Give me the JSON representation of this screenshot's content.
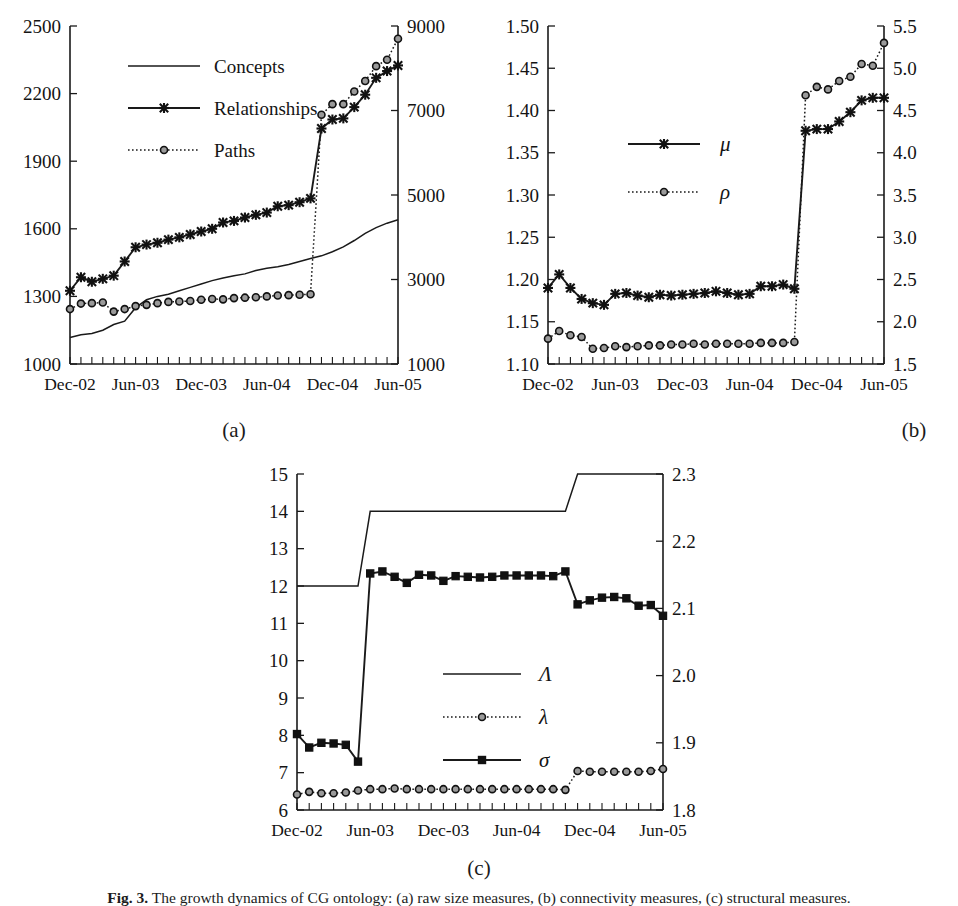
{
  "figure": {
    "caption_prefix": "Fig. 3.",
    "caption_text": "The growth dynamics of CG ontology: (a) raw size measures, (b) connectivity measures, (c) structural measures.",
    "panel_labels": [
      "(a)",
      "(b)",
      "(c)"
    ]
  },
  "chart_data": [
    {
      "id": "panel-a",
      "type": "line",
      "title": "",
      "xlabel": "",
      "ylabel": "",
      "grid": false,
      "legend_position": "upper-left",
      "x": [
        "Dec-02",
        "Jan-03",
        "Feb-03",
        "Mar-03",
        "Apr-03",
        "May-03",
        "Jun-03",
        "Jul-03",
        "Aug-03",
        "Sep-03",
        "Oct-03",
        "Nov-03",
        "Dec-03",
        "Jan-04",
        "Feb-04",
        "Mar-04",
        "Apr-04",
        "May-04",
        "Jun-04",
        "Jul-04",
        "Aug-04",
        "Sep-04",
        "Oct-04",
        "Nov-04",
        "Dec-04",
        "Jan-05",
        "Feb-05",
        "Mar-05",
        "Apr-05",
        "May-05",
        "Jun-05"
      ],
      "xtick_labels": [
        "Dec-02",
        "Jun-03",
        "Dec-03",
        "Jun-04",
        "Dec-04",
        "Jun-05"
      ],
      "xtick_positions": [
        0,
        6,
        12,
        18,
        24,
        30
      ],
      "left_axis": {
        "label": "",
        "ylim": [
          1000,
          2500
        ],
        "ticks": [
          1000,
          1300,
          1600,
          1900,
          2200,
          2500
        ]
      },
      "right_axis": {
        "label": "",
        "ylim": [
          1000,
          9000
        ],
        "ticks": [
          1000,
          3000,
          5000,
          7000,
          9000
        ]
      },
      "series": [
        {
          "name": "Concepts",
          "axis": "left",
          "style": "plain-line",
          "marker": "none",
          "values": [
            1118,
            1130,
            1135,
            1150,
            1175,
            1190,
            1250,
            1285,
            1300,
            1310,
            1325,
            1340,
            1355,
            1370,
            1382,
            1392,
            1400,
            1415,
            1425,
            1432,
            1442,
            1455,
            1468,
            1480,
            1498,
            1520,
            1548,
            1580,
            1605,
            1625,
            1640
          ]
        },
        {
          "name": "Relationships",
          "axis": "left",
          "style": "solid-line",
          "marker": "cross",
          "values": [
            1325,
            1385,
            1365,
            1378,
            1392,
            1455,
            1518,
            1530,
            1538,
            1552,
            1562,
            1575,
            1588,
            1600,
            1628,
            1635,
            1650,
            1662,
            1672,
            1700,
            1705,
            1718,
            1735,
            2045,
            2085,
            2090,
            2140,
            2195,
            2270,
            2300,
            2325
          ]
        },
        {
          "name": "Paths",
          "axis": "right",
          "style": "dotted-line",
          "marker": "circle",
          "values": [
            2300,
            2430,
            2440,
            2455,
            2240,
            2300,
            2370,
            2400,
            2440,
            2470,
            2480,
            2490,
            2520,
            2540,
            2530,
            2560,
            2570,
            2580,
            2600,
            2620,
            2630,
            2640,
            2650,
            6900,
            7150,
            7150,
            7450,
            7700,
            8050,
            8200,
            8700
          ]
        }
      ]
    },
    {
      "id": "panel-b",
      "type": "line",
      "title": "",
      "xlabel": "",
      "ylabel": "",
      "grid": false,
      "legend_position": "center",
      "x": [
        "Dec-02",
        "Jan-03",
        "Feb-03",
        "Mar-03",
        "Apr-03",
        "May-03",
        "Jun-03",
        "Jul-03",
        "Aug-03",
        "Sep-03",
        "Oct-03",
        "Nov-03",
        "Dec-03",
        "Jan-04",
        "Feb-04",
        "Mar-04",
        "Apr-04",
        "May-04",
        "Jun-04",
        "Jul-04",
        "Aug-04",
        "Sep-04",
        "Oct-04",
        "Nov-04",
        "Dec-04",
        "Jan-05",
        "Feb-05",
        "Mar-05",
        "Apr-05",
        "May-05",
        "Jun-05"
      ],
      "xtick_labels": [
        "Dec-02",
        "Jun-03",
        "Dec-03",
        "Jun-04",
        "Dec-04",
        "Jun-05"
      ],
      "xtick_positions": [
        0,
        6,
        12,
        18,
        24,
        30
      ],
      "left_axis": {
        "label": "",
        "ylim": [
          1.1,
          1.5
        ],
        "ticks": [
          1.1,
          1.15,
          1.2,
          1.25,
          1.3,
          1.35,
          1.4,
          1.45,
          1.5
        ]
      },
      "right_axis": {
        "label": "",
        "ylim": [
          1.5,
          5.5
        ],
        "ticks": [
          1.5,
          2.0,
          2.5,
          3.0,
          3.5,
          4.0,
          4.5,
          5.0,
          5.5
        ]
      },
      "series": [
        {
          "name": "μ",
          "axis": "left",
          "style": "solid-line",
          "marker": "cross",
          "values": [
            1.19,
            1.206,
            1.19,
            1.177,
            1.172,
            1.17,
            1.183,
            1.184,
            1.181,
            1.179,
            1.182,
            1.181,
            1.182,
            1.183,
            1.184,
            1.186,
            1.184,
            1.182,
            1.183,
            1.192,
            1.192,
            1.194,
            1.189,
            1.376,
            1.378,
            1.378,
            1.387,
            1.398,
            1.412,
            1.415,
            1.415
          ]
        },
        {
          "name": "ρ",
          "axis": "right",
          "style": "dotted-line",
          "marker": "circle",
          "values": [
            1.8,
            1.89,
            1.84,
            1.82,
            1.68,
            1.69,
            1.71,
            1.7,
            1.71,
            1.72,
            1.72,
            1.73,
            1.73,
            1.74,
            1.73,
            1.74,
            1.74,
            1.74,
            1.74,
            1.75,
            1.75,
            1.75,
            1.76,
            4.68,
            4.78,
            4.75,
            4.85,
            4.9,
            5.05,
            5.03,
            5.3
          ]
        }
      ]
    },
    {
      "id": "panel-c",
      "type": "line",
      "title": "",
      "xlabel": "",
      "ylabel": "",
      "grid": false,
      "legend_position": "center",
      "x": [
        "Dec-02",
        "Jan-03",
        "Feb-03",
        "Mar-03",
        "Apr-03",
        "May-03",
        "Jun-03",
        "Jul-03",
        "Aug-03",
        "Sep-03",
        "Oct-03",
        "Nov-03",
        "Dec-03",
        "Jan-04",
        "Feb-04",
        "Mar-04",
        "Apr-04",
        "May-04",
        "Jun-04",
        "Jul-04",
        "Aug-04",
        "Sep-04",
        "Oct-04",
        "Nov-04",
        "Dec-04",
        "Jan-05",
        "Feb-05",
        "Mar-05",
        "Apr-05",
        "May-05",
        "Jun-05"
      ],
      "xtick_labels": [
        "Dec-02",
        "Jun-03",
        "Dec-03",
        "Jun-04",
        "Dec-04",
        "Jun-05"
      ],
      "xtick_positions": [
        0,
        6,
        12,
        18,
        24,
        30
      ],
      "left_axis": {
        "label": "",
        "ylim": [
          6,
          15
        ],
        "ticks": [
          6,
          7,
          8,
          9,
          10,
          11,
          12,
          13,
          14,
          15
        ]
      },
      "right_axis": {
        "label": "",
        "ylim": [
          1.8,
          2.3
        ],
        "ticks": [
          1.8,
          1.9,
          2.0,
          2.1,
          2.2,
          2.3
        ]
      },
      "series": [
        {
          "name": "Λ",
          "axis": "left",
          "style": "plain-line",
          "marker": "none",
          "values": [
            12,
            12,
            12,
            12,
            12,
            12,
            14,
            14,
            14,
            14,
            14,
            14,
            14,
            14,
            14,
            14,
            14,
            14,
            14,
            14,
            14,
            14,
            14,
            15,
            15,
            15,
            15,
            15,
            15,
            15,
            15
          ]
        },
        {
          "name": "λ",
          "axis": "right",
          "style": "dotted-line",
          "marker": "circle",
          "values": [
            1.823,
            1.827,
            1.825,
            1.825,
            1.826,
            1.829,
            1.831,
            1.831,
            1.832,
            1.831,
            1.831,
            1.831,
            1.831,
            1.831,
            1.831,
            1.831,
            1.831,
            1.831,
            1.831,
            1.831,
            1.831,
            1.831,
            1.83,
            1.858,
            1.857,
            1.857,
            1.857,
            1.857,
            1.857,
            1.858,
            1.861
          ]
        },
        {
          "name": "σ",
          "axis": "right",
          "style": "solid-line",
          "marker": "square",
          "values": [
            1.913,
            1.893,
            1.9,
            1.899,
            1.897,
            1.872,
            2.152,
            2.155,
            2.147,
            2.138,
            2.15,
            2.149,
            2.141,
            2.148,
            2.147,
            2.146,
            2.147,
            2.149,
            2.149,
            2.149,
            2.149,
            2.148,
            2.155,
            2.106,
            2.112,
            2.116,
            2.117,
            2.115,
            2.104,
            2.105,
            2.089
          ]
        }
      ]
    }
  ]
}
